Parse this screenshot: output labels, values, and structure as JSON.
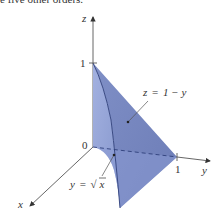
{
  "caption_fragment": "e five other orders.",
  "axes": {
    "z": {
      "label": "z",
      "tick_label": "1"
    },
    "y": {
      "label": "y",
      "tick_label": "1"
    },
    "x": {
      "label": "x"
    },
    "origin_label": "0"
  },
  "annotations": {
    "plane": {
      "var": "z",
      "eq": "=",
      "rhs": "1 − y"
    },
    "cylinder": {
      "var": "y",
      "eq": "=",
      "sqrt_symbol": "√",
      "radicand": "x"
    }
  },
  "colors": {
    "surface_light": "#8fa0d6",
    "surface_dark": "#7384be",
    "edge": "#2f3f7a",
    "axis": "#555555",
    "text": "#333333"
  }
}
